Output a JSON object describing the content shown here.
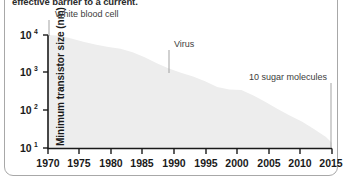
{
  "figure": {
    "caption": "effective barrier to a current.",
    "frame_color": "#a8a8a8",
    "background_color": "#ffffff"
  },
  "axes": {
    "y_axis_title": "Minimum transistor size (nm)",
    "y_ticks": [
      {
        "base": "10",
        "exponent": "4",
        "value": 10000
      },
      {
        "base": "10",
        "exponent": "3",
        "value": 1000
      },
      {
        "base": "10",
        "exponent": "2",
        "value": 100
      },
      {
        "base": "10",
        "exponent": "1",
        "value": 10
      }
    ],
    "x_ticks": [
      "1970",
      "1975",
      "1980",
      "1985",
      "1990",
      "1995",
      "2000",
      "2005",
      "2010",
      "2015"
    ],
    "axis_color": "#1a1a1a"
  },
  "annotations": [
    {
      "label": "White blood cell",
      "year": 1970,
      "value": 10000
    },
    {
      "label": "Virus",
      "year": 1990,
      "value": 1000
    },
    {
      "label": "10 sugar molecules",
      "year": 2015,
      "value": 14
    }
  ],
  "chart_data": {
    "type": "area",
    "title": "",
    "subtitle": "",
    "xlabel": "",
    "ylabel": "Minimum transistor size (nm)",
    "xlim": [
      1968,
      2015
    ],
    "ylim": [
      10,
      10000
    ],
    "yscale": "log",
    "grid": false,
    "legend": "none",
    "fill_color": "#ededed",
    "x": [
      1968,
      1970,
      1972,
      1974,
      1976,
      1978,
      1980,
      1982,
      1984,
      1986,
      1988,
      1990,
      1992,
      1994,
      1996,
      1998,
      2000,
      2002,
      2004,
      2006,
      2008,
      2010,
      2012,
      2014,
      2015
    ],
    "values": [
      10000,
      9500,
      8000,
      6500,
      5500,
      4800,
      4300,
      3500,
      2600,
      1800,
      1300,
      1000,
      800,
      600,
      420,
      360,
      350,
      250,
      170,
      110,
      75,
      52,
      33,
      20,
      14
    ],
    "annotations": [
      "White blood cell",
      "Virus",
      "10 sugar molecules"
    ],
    "series": [
      {
        "name": "Minimum transistor size",
        "values": [
          10000,
          9500,
          8000,
          6500,
          5500,
          4800,
          4300,
          3500,
          2600,
          1800,
          1300,
          1000,
          800,
          600,
          420,
          360,
          350,
          250,
          170,
          110,
          75,
          52,
          33,
          20,
          14
        ]
      }
    ]
  }
}
